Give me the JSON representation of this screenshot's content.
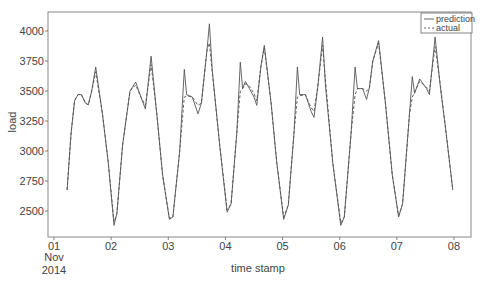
{
  "chart_data": {
    "type": "line",
    "title": "",
    "xlabel": "time stamp",
    "ylabel": "load",
    "x_unit": "days since 2014-11-01 00:00",
    "xlim": [
      -0.11,
      7.29
    ],
    "ylim": [
      2300,
      4160
    ],
    "grid": false,
    "legend_position": "top-right",
    "x_ticks": [
      {
        "pos": 0,
        "label": "01",
        "sub1": "Nov",
        "sub2": "2014"
      },
      {
        "pos": 1,
        "label": "02"
      },
      {
        "pos": 2,
        "label": "03"
      },
      {
        "pos": 3,
        "label": "04"
      },
      {
        "pos": 4,
        "label": "05"
      },
      {
        "pos": 5,
        "label": "06"
      },
      {
        "pos": 6,
        "label": "07"
      },
      {
        "pos": 7,
        "label": "08"
      }
    ],
    "y_ticks": [
      2500,
      2750,
      3000,
      3250,
      3500,
      3750,
      4000
    ],
    "x": [
      0.23,
      0.3,
      0.36,
      0.42,
      0.48,
      0.55,
      0.6,
      0.66,
      0.73,
      0.85,
      0.95,
      1.05,
      1.1,
      1.2,
      1.33,
      1.43,
      1.52,
      1.6,
      1.7,
      1.8,
      1.9,
      2.02,
      2.08,
      2.2,
      2.28,
      2.32,
      2.42,
      2.52,
      2.58,
      2.68,
      2.72,
      2.77,
      2.9,
      3.03,
      3.1,
      3.2,
      3.26,
      3.3,
      3.35,
      3.42,
      3.5,
      3.55,
      3.62,
      3.68,
      3.8,
      3.9,
      4.02,
      4.1,
      4.2,
      4.26,
      4.3,
      4.4,
      4.5,
      4.55,
      4.62,
      4.7,
      4.75,
      4.88,
      5.02,
      5.08,
      5.2,
      5.27,
      5.31,
      5.4,
      5.47,
      5.52,
      5.58,
      5.68,
      5.8,
      5.92,
      6.03,
      6.1,
      6.22,
      6.27,
      6.31,
      6.4,
      6.52,
      6.57,
      6.67,
      6.77,
      6.85,
      6.98
    ],
    "series": [
      {
        "name": "prediction",
        "style": "solid",
        "color": "#555555",
        "values": [
          2675,
          3150,
          3420,
          3470,
          3470,
          3400,
          3385,
          3500,
          3700,
          3300,
          2900,
          2380,
          2480,
          3050,
          3500,
          3575,
          3450,
          3350,
          3790,
          3300,
          2800,
          2430,
          2450,
          3000,
          3680,
          3470,
          3450,
          3310,
          3400,
          3850,
          4060,
          3670,
          3050,
          2490,
          2560,
          3150,
          3740,
          3520,
          3580,
          3520,
          3450,
          3380,
          3700,
          3880,
          3400,
          2900,
          2430,
          2550,
          3150,
          3700,
          3470,
          3470,
          3330,
          3280,
          3550,
          3950,
          3550,
          2900,
          2380,
          2450,
          3150,
          3700,
          3520,
          3520,
          3430,
          3530,
          3750,
          3920,
          3400,
          2800,
          2450,
          2560,
          3300,
          3620,
          3480,
          3600,
          3520,
          3470,
          3950,
          3500,
          3200,
          2675
        ]
      },
      {
        "name": "actual",
        "style": "dashed",
        "color": "#555555",
        "values": [
          2675,
          3150,
          3420,
          3470,
          3470,
          3400,
          3385,
          3500,
          3660,
          3300,
          2900,
          2410,
          2480,
          3050,
          3500,
          3550,
          3450,
          3380,
          3720,
          3300,
          2800,
          2440,
          2450,
          3000,
          3450,
          3460,
          3450,
          3380,
          3400,
          3850,
          3900,
          3650,
          3050,
          2510,
          2560,
          3150,
          3500,
          3520,
          3560,
          3540,
          3480,
          3420,
          3700,
          3860,
          3400,
          2900,
          2450,
          2550,
          3150,
          3450,
          3460,
          3470,
          3360,
          3330,
          3550,
          3880,
          3600,
          2900,
          2400,
          2450,
          3150,
          3470,
          3520,
          3520,
          3500,
          3520,
          3750,
          3900,
          3400,
          2800,
          2460,
          2560,
          3300,
          3450,
          3490,
          3580,
          3530,
          3500,
          3870,
          3520,
          3200,
          2675
        ]
      }
    ]
  },
  "legend": {
    "items": [
      {
        "label": "prediction",
        "style": "solid"
      },
      {
        "label": "actual",
        "style": "dashed"
      }
    ]
  }
}
